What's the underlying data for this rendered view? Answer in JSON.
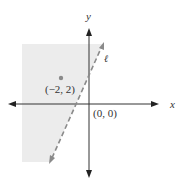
{
  "diagram": {
    "type": "coordinate-plane-half-plane",
    "axes": {
      "x_label": "x",
      "y_label": "y",
      "origin_label": "(0, 0)"
    },
    "line": {
      "label": "ℓ",
      "style": "dashed"
    },
    "point": {
      "label": "(−2, 2)",
      "x": -2,
      "y": 2
    },
    "shaded_region": "left of line ℓ",
    "colors": {
      "shade": "#ececec",
      "axis": "#333333",
      "line": "#8a8a8a",
      "point": "#8a8a8a"
    }
  }
}
